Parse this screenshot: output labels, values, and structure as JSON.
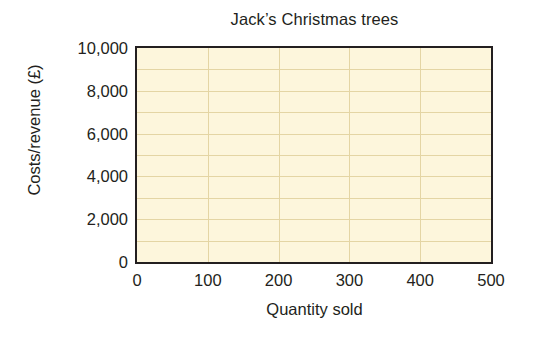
{
  "chart_data": {
    "type": "line",
    "title": "Jack’s Christmas trees",
    "xlabel": "Quantity sold",
    "ylabel": "Costs/revenue (£)",
    "xlim": [
      0,
      500
    ],
    "ylim": [
      0,
      10000
    ],
    "x_tick_labels": [
      "0",
      "100",
      "200",
      "300",
      "400",
      "500"
    ],
    "x_tick_values": [
      0,
      100,
      200,
      300,
      400,
      500
    ],
    "y_tick_labels": [
      "0",
      "2,000",
      "4,000",
      "6,000",
      "8,000",
      "10,000"
    ],
    "y_tick_values": [
      0,
      2000,
      4000,
      6000,
      8000,
      10000
    ],
    "grid": true,
    "grid_x_values": [
      100,
      200,
      300,
      400
    ],
    "grid_y_values": [
      1000,
      2000,
      3000,
      4000,
      5000,
      6000,
      7000,
      8000,
      9000
    ],
    "legend": null,
    "legend_position": "none",
    "series": [],
    "annotations": [],
    "note": "Blank plotting grid — axes, gridlines and labels only, no data plotted",
    "colors": {
      "plot_background": "#fdf6dc",
      "gridline": "#e4d5a4",
      "axis": "#231f20",
      "text": "#231f20",
      "page_background": "#ffffff"
    }
  }
}
